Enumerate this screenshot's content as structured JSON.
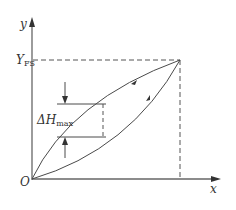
{
  "diagram": {
    "type": "hysteresis-loop",
    "axes": {
      "x_label": "x",
      "y_label": "y",
      "origin_label": "O"
    },
    "annotations": {
      "full_scale_label": "Y",
      "full_scale_subscript": "FS",
      "max_hysteresis_label": "ΔH",
      "max_hysteresis_subscript": "max"
    },
    "curves": [
      {
        "name": "loading",
        "direction": "up",
        "description": "lower curve from origin to full scale point"
      },
      {
        "name": "unloading",
        "direction": "down",
        "description": "upper curve from full scale point back to origin"
      }
    ],
    "colors": {
      "line": "#4a4a4a",
      "axis": "#555555",
      "text": "#333333"
    }
  }
}
